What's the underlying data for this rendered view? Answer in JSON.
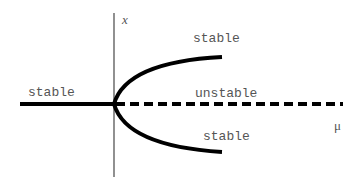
{
  "diagram": {
    "axes": {
      "vertical_label": "x",
      "horizontal_label": "μ"
    },
    "branches": [
      {
        "id": "left-branch",
        "label": "stable",
        "style": "solid"
      },
      {
        "id": "upper-branch",
        "label": "stable",
        "style": "solid"
      },
      {
        "id": "middle-branch",
        "label": "unstable",
        "style": "dashed"
      },
      {
        "id": "lower-branch",
        "label": "stable",
        "style": "solid"
      }
    ],
    "colors": {
      "curve": "#000000",
      "axis": "#555555",
      "text": "#555555",
      "background": "#ffffff"
    }
  }
}
